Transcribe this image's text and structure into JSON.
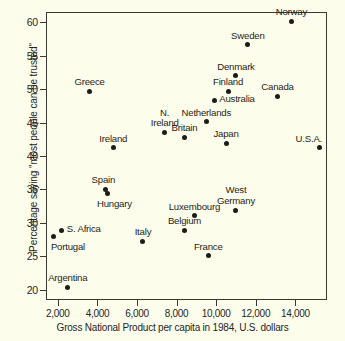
{
  "chart_data": {
    "type": "scatter",
    "title": "",
    "xlabel": "Gross National Product per capita in 1984, U.S. dollars",
    "ylabel": "Percentage saying \"most people can be trusted\"",
    "xlim": [
      1400,
      15600
    ],
    "ylim": [
      18.5,
      61.5
    ],
    "xticks": [
      2000,
      4000,
      6000,
      8000,
      10000,
      12000,
      14000
    ],
    "xticklabels": [
      "2,000",
      "4,000",
      "6,000",
      "8,000",
      "10,000",
      "12,000",
      "14,000"
    ],
    "yticks": [
      20,
      25,
      30,
      35,
      40,
      45,
      50,
      55,
      60
    ],
    "yticklabels": [
      "20",
      "25",
      "30",
      "35",
      "40",
      "45",
      "50",
      "55",
      "60"
    ],
    "grid": false,
    "legend": false,
    "points": [
      {
        "label": "Norway",
        "x": 13800,
        "y": 60.1,
        "label_pos": "above-center"
      },
      {
        "label": "Sweden",
        "x": 11600,
        "y": 56.6,
        "label_pos": "above-center"
      },
      {
        "label": "Denmark",
        "x": 11000,
        "y": 52.0,
        "label_pos": "above-center"
      },
      {
        "label": "Finland",
        "x": 10600,
        "y": 49.7,
        "label_pos": "above-center"
      },
      {
        "label": "Greece",
        "x": 3600,
        "y": 49.7,
        "label_pos": "above-center"
      },
      {
        "label": "Canada",
        "x": 13100,
        "y": 48.9,
        "label_pos": "above-center"
      },
      {
        "label": "Australia",
        "x": 9900,
        "y": 48.3,
        "label_pos": "right"
      },
      {
        "label": "Netherlands",
        "x": 9500,
        "y": 45.1,
        "label_pos": "above-center"
      },
      {
        "label": "N. Ireland",
        "x": 7400,
        "y": 43.5,
        "label_pos": "above-center-two-line"
      },
      {
        "label": "Britain",
        "x": 8400,
        "y": 42.8,
        "label_pos": "above-center"
      },
      {
        "label": "Japan",
        "x": 10500,
        "y": 41.9,
        "label_pos": "above-center"
      },
      {
        "label": "U.S.A.",
        "x": 15200,
        "y": 41.2,
        "label_pos": "above-right"
      },
      {
        "label": "Ireland",
        "x": 4800,
        "y": 41.2,
        "label_pos": "above-center"
      },
      {
        "label": "Spain",
        "x": 4400,
        "y": 35.0,
        "label_pos": "above-left"
      },
      {
        "label": "Hungary",
        "x": 4500,
        "y": 34.4,
        "label_pos": "below-center"
      },
      {
        "label": "West Germany",
        "x": 11000,
        "y": 31.9,
        "label_pos": "above-center-two-line"
      },
      {
        "label": "Luxembourg",
        "x": 8900,
        "y": 31.1,
        "label_pos": "above-center"
      },
      {
        "label": "Belgium",
        "x": 8400,
        "y": 28.9,
        "label_pos": "above-center"
      },
      {
        "label": "S. Africa",
        "x": 2200,
        "y": 28.9,
        "label_pos": "right"
      },
      {
        "label": "Portugal",
        "x": 1800,
        "y": 28.0,
        "label_pos": "below-right"
      },
      {
        "label": "Italy",
        "x": 6300,
        "y": 27.3,
        "label_pos": "above-center"
      },
      {
        "label": "France",
        "x": 9600,
        "y": 25.1,
        "label_pos": "above-center"
      },
      {
        "label": "Argentina",
        "x": 2500,
        "y": 20.4,
        "label_pos": "above-center"
      }
    ]
  },
  "colors": {
    "background": "#fdfdec",
    "axis": "#3a3a32",
    "point": "#1d1d18",
    "text": "#25251f"
  }
}
